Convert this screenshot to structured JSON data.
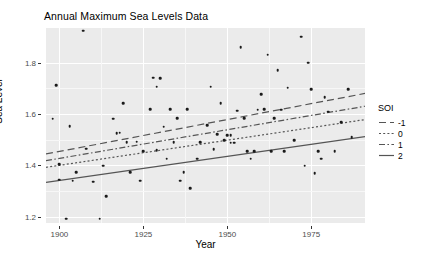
{
  "chart_data": {
    "type": "scatter",
    "title": "Annual Maximum Sea Levels Data",
    "xlabel": "Year",
    "ylabel": "Sea Level",
    "xlim": [
      1896,
      1991
    ],
    "ylim": [
      1.175,
      1.935
    ],
    "xticks": [
      1900,
      1925,
      1950,
      1975
    ],
    "yticks": [
      1.2,
      1.4,
      1.6,
      1.8
    ],
    "xtick_labels": [
      "1900",
      "1925",
      "1950",
      "1975"
    ],
    "ytick_labels": [
      "1.2",
      "1.4",
      "1.6",
      "1.8"
    ],
    "grid": true,
    "legend": {
      "title": "SOI",
      "position": "right",
      "entries": [
        {
          "label": "-1",
          "dash": "long-dash"
        },
        {
          "label": "0",
          "dash": "dotted"
        },
        {
          "label": "1",
          "dash": "dash-dot"
        },
        {
          "label": "2",
          "dash": "solid"
        }
      ]
    },
    "points": [
      {
        "x": 1898,
        "y": 1.582
      },
      {
        "x": 1899,
        "y": 1.711
      },
      {
        "x": 1900,
        "y": 1.343
      },
      {
        "x": 1900,
        "y": 1.404
      },
      {
        "x": 1902,
        "y": 1.192
      },
      {
        "x": 1903,
        "y": 1.553
      },
      {
        "x": 1904,
        "y": 1.34
      },
      {
        "x": 1905,
        "y": 1.372
      },
      {
        "x": 1907,
        "y": 1.925
      },
      {
        "x": 1908,
        "y": 1.465
      },
      {
        "x": 1910,
        "y": 1.336
      },
      {
        "x": 1912,
        "y": 1.192
      },
      {
        "x": 1913,
        "y": 1.399
      },
      {
        "x": 1914,
        "y": 1.279
      },
      {
        "x": 1916,
        "y": 1.582
      },
      {
        "x": 1917,
        "y": 1.524
      },
      {
        "x": 1918,
        "y": 1.527
      },
      {
        "x": 1919,
        "y": 1.643
      },
      {
        "x": 1920,
        "y": 1.489
      },
      {
        "x": 1921,
        "y": 1.373
      },
      {
        "x": 1923,
        "y": 1.492
      },
      {
        "x": 1924,
        "y": 1.34
      },
      {
        "x": 1925,
        "y": 1.455
      },
      {
        "x": 1927,
        "y": 1.618
      },
      {
        "x": 1928,
        "y": 1.742
      },
      {
        "x": 1929,
        "y": 1.707
      },
      {
        "x": 1929,
        "y": 1.459
      },
      {
        "x": 1930,
        "y": 1.74
      },
      {
        "x": 1931,
        "y": 1.55
      },
      {
        "x": 1932,
        "y": 1.425
      },
      {
        "x": 1933,
        "y": 1.618
      },
      {
        "x": 1934,
        "y": 1.491
      },
      {
        "x": 1935,
        "y": 1.583
      },
      {
        "x": 1936,
        "y": 1.34
      },
      {
        "x": 1937,
        "y": 1.374
      },
      {
        "x": 1938,
        "y": 1.618
      },
      {
        "x": 1939,
        "y": 1.311
      },
      {
        "x": 1941,
        "y": 1.425
      },
      {
        "x": 1942,
        "y": 1.489
      },
      {
        "x": 1944,
        "y": 1.557
      },
      {
        "x": 1945,
        "y": 1.707
      },
      {
        "x": 1946,
        "y": 1.462
      },
      {
        "x": 1947,
        "y": 1.52
      },
      {
        "x": 1948,
        "y": 1.643
      },
      {
        "x": 1949,
        "y": 1.498
      },
      {
        "x": 1950,
        "y": 1.517
      },
      {
        "x": 1951,
        "y": 1.517
      },
      {
        "x": 1951,
        "y": 1.488
      },
      {
        "x": 1952,
        "y": 1.488
      },
      {
        "x": 1953,
        "y": 1.613
      },
      {
        "x": 1954,
        "y": 1.86
      },
      {
        "x": 1955,
        "y": 1.583
      },
      {
        "x": 1956,
        "y": 1.455
      },
      {
        "x": 1957,
        "y": 1.425
      },
      {
        "x": 1958,
        "y": 1.455
      },
      {
        "x": 1959,
        "y": 1.617
      },
      {
        "x": 1960,
        "y": 1.676
      },
      {
        "x": 1961,
        "y": 1.618
      },
      {
        "x": 1962,
        "y": 1.831
      },
      {
        "x": 1963,
        "y": 1.455
      },
      {
        "x": 1964,
        "y": 1.583
      },
      {
        "x": 1965,
        "y": 1.77
      },
      {
        "x": 1966,
        "y": 1.617
      },
      {
        "x": 1967,
        "y": 1.455
      },
      {
        "x": 1968,
        "y": 1.702
      },
      {
        "x": 1970,
        "y": 1.497
      },
      {
        "x": 1972,
        "y": 1.901
      },
      {
        "x": 1973,
        "y": 1.398
      },
      {
        "x": 1974,
        "y": 1.8
      },
      {
        "x": 1975,
        "y": 1.697
      },
      {
        "x": 1976,
        "y": 1.37
      },
      {
        "x": 1977,
        "y": 1.455
      },
      {
        "x": 1978,
        "y": 1.425
      },
      {
        "x": 1979,
        "y": 1.665
      },
      {
        "x": 1980,
        "y": 1.608
      },
      {
        "x": 1982,
        "y": 1.455
      },
      {
        "x": 1984,
        "y": 1.568
      },
      {
        "x": 1986,
        "y": 1.697
      },
      {
        "x": 1987,
        "y": 1.509
      }
    ],
    "fit_lines": [
      {
        "soi": "-1",
        "dash": "long-dash",
        "x0": 1896,
        "y0": 1.444,
        "x1": 1991,
        "y1": 1.68
      },
      {
        "soi": "0",
        "dash": "dotted",
        "x0": 1896,
        "y0": 1.392,
        "x1": 1991,
        "y1": 1.578
      },
      {
        "soi": "1",
        "dash": "dash-dot",
        "x0": 1896,
        "y0": 1.418,
        "x1": 1991,
        "y1": 1.63
      },
      {
        "soi": "2",
        "dash": "solid",
        "x0": 1896,
        "y0": 1.333,
        "x1": 1991,
        "y1": 1.512
      }
    ],
    "colors": {
      "panel_background": "#ebebeb",
      "grid_major": "#ffffff",
      "point": "#1a1a1a",
      "line": "#555555",
      "tick_text": "#4d4d4d",
      "axis_text": "#000000"
    }
  }
}
